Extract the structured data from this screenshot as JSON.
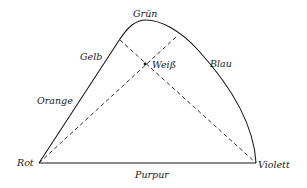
{
  "diagram": {
    "type": "color-triangle",
    "vertices": {
      "red": "Rot",
      "green": "Grün",
      "violet": "Violett"
    },
    "edge_labels": {
      "yellow": "Gelb",
      "orange": "Orange",
      "blue": "Blau",
      "purple": "Purpur"
    },
    "center_label": "Weiß",
    "colors": {
      "stroke": "#1a1a1a",
      "background": "#ffffff"
    }
  }
}
